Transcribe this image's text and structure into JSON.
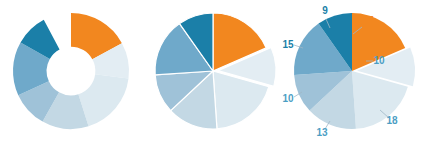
{
  "figure": {
    "title": "",
    "background_color": "#ffffff",
    "width": 429,
    "height": 143
  },
  "palette": {
    "orange": "#F2871F",
    "dark_teal": "#1B7FA8",
    "mid_blue": "#4C9EC4",
    "steel_blue": "#8DB8D4",
    "pale_blue": "#B9D3E2",
    "lighter_blue": "#CFE0EA",
    "lightest_blue": "#E3EDF3",
    "separator": "#FFFFFF"
  },
  "chart_data": [
    {
      "type": "pie",
      "name": "donut-chart",
      "title": "",
      "variant": "donut",
      "hole_ratio": 0.42,
      "gap_degrees": 28,
      "start_angle_deg": 0,
      "categories": [
        "17",
        "10",
        "18",
        "13",
        "10",
        "15",
        "9"
      ],
      "values": [
        17,
        10,
        18,
        13,
        10,
        15,
        9
      ],
      "colors": [
        "#F2871F",
        "#E3EDF3",
        "#DCE9F0",
        "#C3D8E4",
        "#9FC2D8",
        "#6FA9CA",
        "#1B7FA8"
      ],
      "labels_visible": false,
      "legend": "none"
    },
    {
      "type": "pie",
      "name": "exploded-pie-chart",
      "title": "",
      "variant": "pie",
      "separators": true,
      "exploded_index": 1,
      "explode_offset_px": 5,
      "start_angle_deg": 0,
      "categories": [
        "17",
        "10",
        "18",
        "13",
        "10",
        "15",
        "9"
      ],
      "values": [
        17,
        10,
        18,
        13,
        10,
        15,
        9
      ],
      "colors": [
        "#F2871F",
        "#E3EDF3",
        "#DCE9F0",
        "#C3D8E4",
        "#9FC2D8",
        "#6FA9CA",
        "#1B7FA8"
      ],
      "labels_visible": false,
      "legend": "none"
    },
    {
      "type": "pie",
      "name": "labeled-pie-chart",
      "title": "",
      "variant": "pie",
      "separators": false,
      "exploded_index": 1,
      "explode_offset_px": 5,
      "start_angle_deg": 0,
      "categories": [
        "17",
        "10",
        "18",
        "13",
        "10",
        "15",
        "9"
      ],
      "values": [
        17,
        10,
        18,
        13,
        10,
        15,
        9
      ],
      "colors": [
        "#F2871F",
        "#E3EDF3",
        "#DCE9F0",
        "#C3D8E4",
        "#9FC2D8",
        "#6FA9CA",
        "#1B7FA8"
      ],
      "labels_visible": true,
      "legend": "none",
      "data_labels": [
        {
          "text": "17",
          "color": "#F2871F",
          "x": 368,
          "y": 24
        },
        {
          "text": "10",
          "color": "#4C9EC4",
          "x": 379,
          "y": 64
        },
        {
          "text": "18",
          "color": "#4C9EC4",
          "x": 392,
          "y": 124
        },
        {
          "text": "13",
          "color": "#4C9EC4",
          "x": 322,
          "y": 136
        },
        {
          "text": "10",
          "color": "#4C9EC4",
          "x": 288,
          "y": 102
        },
        {
          "text": "15",
          "color": "#1B7FA8",
          "x": 288,
          "y": 48
        },
        {
          "text": "9",
          "color": "#1B7FA8",
          "x": 325,
          "y": 14
        }
      ],
      "leader_lines": [
        {
          "x1": 362,
          "y1": 27,
          "x2": 353,
          "y2": 34
        },
        {
          "x1": 373,
          "y1": 61,
          "x2": 366,
          "y2": 61
        },
        {
          "x1": 389,
          "y1": 118,
          "x2": 380,
          "y2": 110
        },
        {
          "x1": 325,
          "y1": 129,
          "x2": 330,
          "y2": 121
        },
        {
          "x1": 294,
          "y1": 97,
          "x2": 302,
          "y2": 92
        },
        {
          "x1": 294,
          "y1": 45,
          "x2": 303,
          "y2": 48
        },
        {
          "x1": 326,
          "y1": 19,
          "x2": 330,
          "y2": 28
        }
      ]
    }
  ]
}
